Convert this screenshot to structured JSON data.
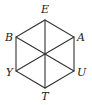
{
  "diagram": {
    "type": "regular-hexagon-with-diagonals",
    "stroke_color": "#333333",
    "center": {
      "x": 45,
      "y": 54
    },
    "vertices": [
      {
        "id": "E",
        "label": "E",
        "x": 45,
        "y": 20,
        "lx": 45,
        "ly": 13,
        "anchor": "middle"
      },
      {
        "id": "A",
        "label": "A",
        "x": 74,
        "y": 37,
        "lx": 77,
        "ly": 41,
        "anchor": "start"
      },
      {
        "id": "U",
        "label": "U",
        "x": 74,
        "y": 71,
        "lx": 77,
        "ly": 76,
        "anchor": "start"
      },
      {
        "id": "T",
        "label": "T",
        "x": 45,
        "y": 88,
        "lx": 45,
        "ly": 100,
        "anchor": "middle"
      },
      {
        "id": "Y",
        "label": "Y",
        "x": 16,
        "y": 71,
        "lx": 13,
        "ly": 76,
        "anchor": "end"
      },
      {
        "id": "B",
        "label": "B",
        "x": 16,
        "y": 37,
        "lx": 13,
        "ly": 41,
        "anchor": "end"
      }
    ],
    "diagonals": [
      [
        "E",
        "T"
      ],
      [
        "B",
        "U"
      ],
      [
        "A",
        "Y"
      ]
    ]
  }
}
